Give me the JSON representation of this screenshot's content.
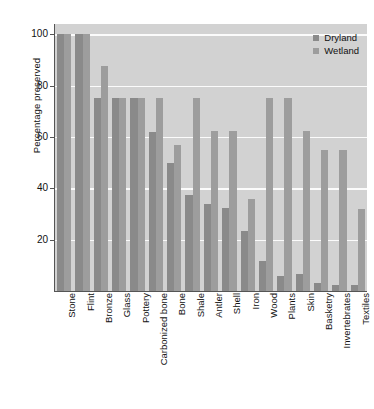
{
  "chart_data": {
    "type": "bar",
    "title": "",
    "xlabel": "",
    "ylabel": "Percentage preserved",
    "ylim": [
      0,
      104
    ],
    "yticks": [
      20,
      40,
      60,
      80,
      100
    ],
    "ytick_labels": [
      "20",
      "40",
      "60",
      "80",
      "100"
    ],
    "grid": true,
    "grid_axis": "y",
    "legend_position": "top-right-inside",
    "orientation": "vertical",
    "grouping": "grouped",
    "categories": [
      "Stone",
      "Flint",
      "Bronze",
      "Glass",
      "Pottery",
      "Carbonized bone",
      "Bone",
      "Shale",
      "Antler",
      "Shell",
      "Iron",
      "Wood",
      "Plants",
      "Skin",
      "Basketry",
      "Invertebrates",
      "Textiles"
    ],
    "series": [
      {
        "name": "Dryland",
        "color": "#8a8a8a",
        "values": [
          100,
          100,
          75,
          75,
          75,
          62,
          50,
          37.5,
          34,
          32.5,
          23.5,
          11.5,
          6,
          6.5,
          3,
          2.5,
          2.5
        ]
      },
      {
        "name": "Wetland",
        "color": "#9d9d9d",
        "values": [
          100,
          100,
          87.5,
          75,
          75,
          75,
          57,
          75,
          62.5,
          62.5,
          36,
          75,
          75,
          62.5,
          55,
          55,
          32
        ]
      }
    ]
  },
  "legend": {
    "entries": [
      {
        "label": "Dryland"
      },
      {
        "label": "Wetland"
      }
    ]
  },
  "axes": {
    "y_title": "Percentage preserved"
  },
  "colors": {
    "plot_background": "#d2d2d2",
    "gridline": "#fbfbfb",
    "axis_line": "#555555",
    "dryland": "#8a8a8a",
    "wetland": "#9d9d9d",
    "text": "#111111"
  }
}
